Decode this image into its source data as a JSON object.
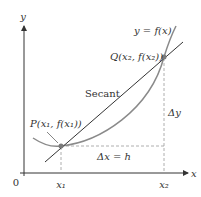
{
  "diagram": {
    "axes": {
      "x_label": "x",
      "y_label": "y",
      "origin_label": "0"
    },
    "curve_label": "y = f(x)",
    "secant_label": "Secant",
    "point_p_label": "P(x₁, f(x₁))",
    "point_q_label": "Q(x₂, f(x₂))",
    "delta_x_label": "Δx = h",
    "delta_y_label": "Δy",
    "x1_tick_label": "x₁",
    "x2_tick_label": "x₂",
    "colors": {
      "axis": "#333333",
      "curve": "#8a8a8a",
      "secant": "#333333",
      "dashed": "#999999",
      "point": "#7a7a7a"
    }
  }
}
